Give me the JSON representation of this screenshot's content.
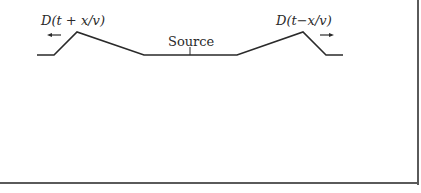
{
  "figure": {
    "labels": {
      "left_wave": "D(t + x/v)",
      "right_wave": "D(t−x/v)",
      "source": "Source"
    },
    "direction_arrows": {
      "left": "←",
      "right": "→"
    },
    "colors": {
      "line": "#2a2a2a",
      "frame": "#5a5a5a",
      "background": "#ffffff"
    }
  }
}
